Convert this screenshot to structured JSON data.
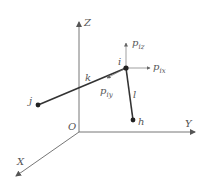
{
  "diagram": {
    "axes": {
      "origin_label": "O",
      "x_label": "X",
      "y_label": "Y",
      "z_label": "Z"
    },
    "nodes": {
      "i": "i",
      "j": "j",
      "h": "h"
    },
    "members": {
      "k": "k",
      "l": "l"
    },
    "forces": {
      "pix": {
        "main": "p",
        "sub": "ix"
      },
      "piy": {
        "main": "p",
        "sub": "iy"
      },
      "piz": {
        "main": "p",
        "sub": "iz"
      }
    },
    "colors": {
      "axis": "#666666",
      "member": "#333333",
      "node": "#222222",
      "text": "#555555"
    }
  }
}
